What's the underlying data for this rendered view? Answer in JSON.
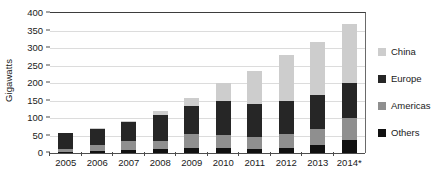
{
  "chart_data": {
    "type": "bar",
    "stacked": true,
    "title": "",
    "xlabel": "",
    "ylabel": "Gigawatts",
    "ylim": [
      0,
      400
    ],
    "ytick_step": 50,
    "yticks": [
      0,
      50,
      100,
      150,
      200,
      250,
      300,
      350,
      400
    ],
    "grid": true,
    "grid_axis": "y",
    "legend_position": "right",
    "categories": [
      "2005",
      "2006",
      "2007",
      "2008",
      "2009",
      "2010",
      "2011",
      "2012",
      "2013",
      "2014*"
    ],
    "series": [
      {
        "name": "Others",
        "color": "#111111",
        "stack_order": 1,
        "values": [
          4,
          5,
          9,
          11,
          13,
          15,
          11,
          15,
          23,
          38
        ]
      },
      {
        "name": "Americas",
        "color": "#8f8f8f",
        "stack_order": 2,
        "values": [
          7,
          18,
          24,
          22,
          41,
          36,
          34,
          40,
          46,
          63
        ]
      },
      {
        "name": "Europe",
        "color": "#262626",
        "stack_order": 3,
        "values": [
          45,
          46,
          56,
          75,
          79,
          97,
          95,
          95,
          97,
          98
        ]
      },
      {
        "name": "China",
        "color": "#cdcdcd",
        "stack_order": 4,
        "values": [
          2,
          2,
          2,
          13,
          25,
          52,
          95,
          130,
          150,
          171
        ]
      }
    ],
    "totals": [
      58,
      71,
      91,
      121,
      158,
      200,
      235,
      280,
      316,
      370
    ],
    "series_order_bottom_to_top": [
      "Others",
      "Americas",
      "Europe",
      "China"
    ],
    "legend_order": [
      "China",
      "Europe",
      "Americas",
      "Others"
    ]
  },
  "legend": {
    "items": [
      {
        "label": "China",
        "color": "#cdcdcd",
        "swatch_name": "legend-swatch-china"
      },
      {
        "label": "Europe",
        "color": "#262626",
        "swatch_name": "legend-swatch-europe"
      },
      {
        "label": "Americas",
        "color": "#8f8f8f",
        "swatch_name": "legend-swatch-americas"
      },
      {
        "label": "Others",
        "color": "#111111",
        "swatch_name": "legend-swatch-others"
      }
    ]
  },
  "axes": {
    "y_title": "Gigawatts"
  },
  "colors": {
    "china": "#cdcdcd",
    "europe": "#262626",
    "americas": "#8f8f8f",
    "others": "#111111",
    "gridline": "#dcdcdc",
    "axis": "#4d4d4d",
    "text": "#1a1a1a",
    "background": "#ffffff"
  }
}
